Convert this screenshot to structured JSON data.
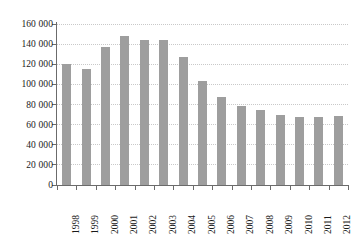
{
  "chart_data": {
    "type": "bar",
    "title": "",
    "subtitle": "",
    "xlabel": "",
    "ylabel": "",
    "categories": [
      "1998",
      "1999",
      "2000",
      "2001",
      "2002",
      "2003",
      "2004",
      "2005",
      "2006",
      "2007",
      "2008",
      "2009",
      "2010",
      "2011",
      "2012"
    ],
    "values": [
      120000,
      115000,
      137000,
      148000,
      144000,
      144000,
      127000,
      103000,
      87000,
      79000,
      75000,
      70000,
      68000,
      68000,
      69000
    ],
    "ylim": [
      0,
      160000
    ],
    "ytick_values": [
      0,
      20000,
      40000,
      60000,
      80000,
      100000,
      120000,
      140000,
      160000
    ],
    "ytick_labels": [
      "0",
      "20 000",
      "40 000",
      "60 000",
      "80 000",
      "100 000",
      "120 000",
      "140 000",
      "160 000"
    ],
    "grid": true,
    "grid_axis": "y",
    "grid_style": "dotted",
    "legend": null,
    "legend_position": "none",
    "bar_color": "#9e9e9e",
    "axis_color": "#6b6b6b",
    "grid_color": "#c9c9c9",
    "text_color": "#1a1a1a",
    "xtick_label_rotation": -90,
    "annotations": []
  }
}
